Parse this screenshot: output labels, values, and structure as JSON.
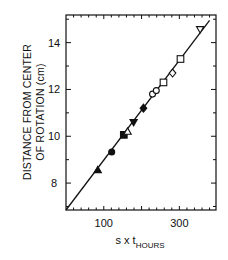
{
  "chart_data": {
    "type": "scatter",
    "title": "",
    "xlabel": "s x t",
    "xlabel_subscript": "HOURS",
    "ylabel_line1": "DISTANCE FROM CENTER",
    "ylabel_line2": "OF ROTATION (cm)",
    "xlim": [
      0,
      397
    ],
    "ylim": [
      6.85,
      15.18
    ],
    "x_ticks_labeled": [
      100,
      300
    ],
    "x_tick_labels": [
      "100",
      "300"
    ],
    "x_major_ticks": [
      100,
      200,
      300
    ],
    "x_minor_step": 20,
    "y_ticks_labeled": [
      8,
      10,
      12,
      14
    ],
    "y_tick_labels": [
      "8",
      "10",
      "12",
      "14"
    ],
    "y_minor_step": 1,
    "grid": false,
    "legend": null,
    "series": [
      {
        "name": "filled-triangle",
        "marker": "triangle-filled",
        "x": [
          84
        ],
        "y": [
          8.56
        ]
      },
      {
        "name": "filled-circle",
        "marker": "circle-filled",
        "x": [
          121
        ],
        "y": [
          9.33
        ]
      },
      {
        "name": "filled-square",
        "marker": "square-filled",
        "x": [
          153
        ],
        "y": [
          10.06
        ]
      },
      {
        "name": "open-triangle",
        "marker": "triangle-open",
        "x": [
          163
        ],
        "y": [
          10.2
        ]
      },
      {
        "name": "filled-inverted-triangle",
        "marker": "triangle-down-filled",
        "x": [
          179
        ],
        "y": [
          10.6
        ]
      },
      {
        "name": "filled-diamond",
        "marker": "diamond-filled",
        "x": [
          205
        ],
        "y": [
          11.2
        ]
      },
      {
        "name": "open-circle",
        "marker": "circle-open",
        "x": [
          229,
          239
        ],
        "y": [
          11.8,
          11.95
        ]
      },
      {
        "name": "open-square",
        "marker": "square-open",
        "x": [
          258,
          303
        ],
        "y": [
          12.3,
          13.3
        ]
      },
      {
        "name": "open-diamond",
        "marker": "diamond-open",
        "x": [
          282
        ],
        "y": [
          12.7
        ]
      },
      {
        "name": "open-inverted-triangle",
        "marker": "triangle-down-open",
        "x": [
          355
        ],
        "y": [
          14.57
        ]
      }
    ],
    "fit_line": {
      "x": [
        0,
        380
      ],
      "y": [
        6.85,
        14.95
      ]
    }
  }
}
